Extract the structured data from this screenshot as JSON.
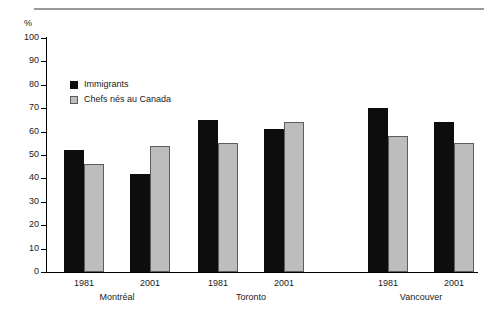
{
  "chart_data": {
    "type": "bar",
    "title": "",
    "subtitle": "",
    "xlabel": "",
    "ylabel": "%",
    "ylim": [
      0,
      100
    ],
    "ytick_step": 10,
    "yticks": [
      "100",
      "90",
      "80",
      "70",
      "60",
      "50",
      "40",
      "30",
      "20",
      "10",
      "0"
    ],
    "grid": false,
    "legend_position": "inside-top-left",
    "categories": [
      "1981",
      "2001",
      "1981",
      "2001",
      "1981",
      "2001"
    ],
    "groups": [
      {
        "name": "Montréal",
        "periods": [
          {
            "year": "1981",
            "immigrants": 52,
            "canadian_born": 46
          },
          {
            "year": "2001",
            "immigrants": 42,
            "canadian_born": 54
          }
        ]
      },
      {
        "name": "Toronto",
        "periods": [
          {
            "year": "1981",
            "immigrants": 65,
            "canadian_born": 55
          },
          {
            "year": "2001",
            "immigrants": 61,
            "canadian_born": 64
          }
        ]
      },
      {
        "name": "Vancouver",
        "periods": [
          {
            "year": "1981",
            "immigrants": 70,
            "canadian_born": 58
          },
          {
            "year": "2001",
            "immigrants": 64,
            "canadian_born": 55
          }
        ]
      }
    ],
    "series": [
      {
        "name": "Immigrants",
        "key": "immigrants",
        "color": "#0d0d0d",
        "values": [
          52,
          42,
          65,
          61,
          70,
          64
        ]
      },
      {
        "name": "Chefs nés au Canada",
        "key": "canadian_born",
        "color": "#bdbdbd",
        "values": [
          46,
          54,
          55,
          64,
          58,
          55
        ]
      }
    ],
    "legend": [
      {
        "label": "Immigrants",
        "swatch": "immigrants"
      },
      {
        "label": "Chefs nés au Canada",
        "swatch": "canadian"
      }
    ]
  }
}
